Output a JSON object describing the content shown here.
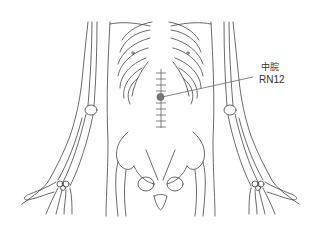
{
  "figure": {
    "acupoint": {
      "name_cn": "中脘",
      "code": "RN12",
      "marker_color": "#777777"
    },
    "line_color": "#444444",
    "leader_color": "#777777",
    "background": "#ffffff"
  }
}
